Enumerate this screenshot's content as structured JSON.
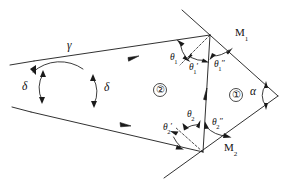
{
  "figure": {
    "background_color": "#ffffff",
    "stroke_color": "#1a1a1a",
    "labels": {
      "gamma": "γ",
      "delta_left": "δ",
      "delta_right": "δ",
      "alpha": "α",
      "mirror1_name": "M",
      "mirror1_sub": "1",
      "mirror2_name": "M",
      "mirror2_sub": "2",
      "region1": "①",
      "region2": "②",
      "theta1": "θ",
      "theta1_sub": "1",
      "theta1_prime": "θ",
      "theta1_prime_sub": "1",
      "theta1_prime_mark": "′",
      "theta1_dprime": "θ",
      "theta1_dprime_sub": "1",
      "theta1_dprime_mark": "″",
      "theta2": "θ",
      "theta2_sub": "2",
      "theta2_prime": "θ",
      "theta2_prime_sub": "2",
      "theta2_prime_mark": "′",
      "theta2_dprime": "θ",
      "theta2_dprime_sub": "2",
      "theta2_dprime_mark": "″"
    }
  },
  "geometry": {
    "vertices": {
      "upper_mirror_point": [
        210,
        35
      ],
      "lower_mirror_point": [
        203,
        152
      ],
      "apex_right": [
        277,
        95
      ],
      "crossing_left": [
        68,
        87
      ]
    },
    "lines": {
      "mirror1": "M182,10 L277,95",
      "mirror2": "M277,95 L166,176",
      "incoming_upper_ray": "M35,62 L210,35",
      "incoming_lower_ray": "M203,152 L32,113",
      "connecting_ray": "M203,152 L210,35",
      "upper_normal_dashed": "M210,35 L181,64",
      "lower_normal_dashed": "M203,152 L176,128"
    }
  }
}
